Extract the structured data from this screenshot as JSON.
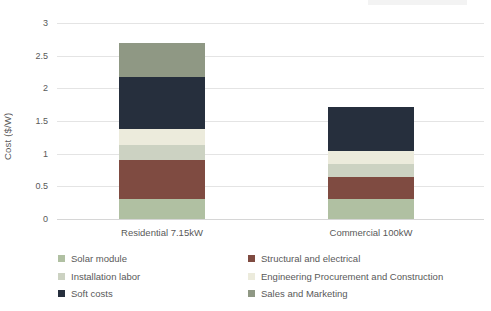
{
  "chart_data": {
    "type": "bar",
    "stacked": true,
    "title": "",
    "xlabel": "",
    "ylabel": "Cost ($/W)",
    "ylim": [
      0,
      3
    ],
    "yticks": [
      0,
      0.5,
      1,
      1.5,
      2,
      2.5,
      3
    ],
    "ytick_labels": [
      "0",
      "0.5",
      "1",
      "1.5",
      "2",
      "2.5",
      "3"
    ],
    "grid": true,
    "legend_position": "bottom",
    "legend_columns": 2,
    "categories": [
      "Residential 7.15kW",
      "Commercial 100kW"
    ],
    "series": [
      {
        "name": "Solar module",
        "color": "#b0c0a2",
        "values": [
          0.3,
          0.3
        ]
      },
      {
        "name": "Structural and electrical",
        "color": "#7f4b41",
        "values": [
          0.61,
          0.34
        ]
      },
      {
        "name": "Installation labor",
        "color": "#ccd2c2",
        "values": [
          0.23,
          0.2
        ]
      },
      {
        "name": "Engineering Procurement and Construction",
        "color": "#ecebdc",
        "values": [
          0.24,
          0.2
        ]
      },
      {
        "name": "Soft costs",
        "color": "#262f3d",
        "values": [
          0.8,
          0.68
        ]
      },
      {
        "name": "Sales and Marketing",
        "color": "#8f9884",
        "values": [
          0.51,
          0.0
        ]
      }
    ],
    "totals": [
      2.69,
      1.72
    ],
    "colors": {
      "background": "#ffffff",
      "gridline": "#e4e4e4",
      "axis_text": "#595959"
    }
  }
}
